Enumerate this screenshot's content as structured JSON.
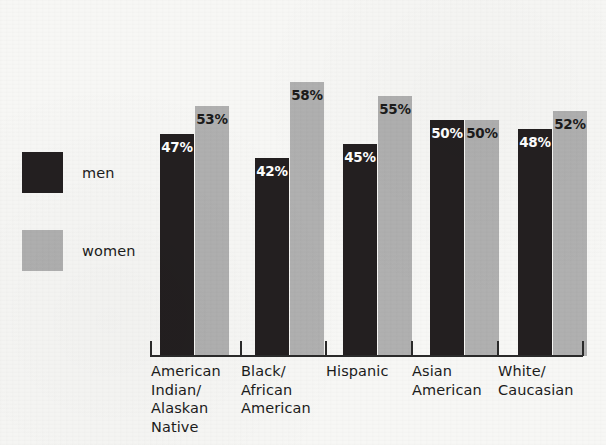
{
  "legend": {
    "items": [
      {
        "key": "men",
        "label": "men",
        "color": "#231f20"
      },
      {
        "key": "women",
        "label": "women",
        "color": "#b0b0b0"
      }
    ]
  },
  "chart_data": {
    "type": "bar",
    "title": "",
    "subtitle": "",
    "xlabel": "",
    "ylabel": "",
    "ylim": [
      0,
      100
    ],
    "grid": false,
    "legend_position": "left",
    "orientation": "vertical",
    "grouping": "grouped",
    "value_label_suffix": "%",
    "categories": [
      "American\nIndian/\nAlaskan\nNative",
      "Black/\nAfrican\nAmerican",
      "Hispanic",
      "Asian\nAmerican",
      "White/\nCaucasian"
    ],
    "series": [
      {
        "name": "men",
        "color": "#231f20",
        "values": [
          47,
          42,
          45,
          50,
          48
        ],
        "labels": [
          "47%",
          "42%",
          "45%",
          "50%",
          "48%"
        ]
      },
      {
        "name": "women",
        "color": "#b0b0b0",
        "values": [
          53,
          58,
          55,
          50,
          52
        ],
        "labels": [
          "53%",
          "58%",
          "55%",
          "50%",
          "52%"
        ]
      }
    ]
  },
  "layout": {
    "baseline_y": 356,
    "bar_width": 34,
    "group_left_positions": [
      160,
      255,
      343,
      430,
      518
    ],
    "tick_positions": [
      150,
      240,
      325,
      411,
      497,
      582
    ],
    "label_left_positions": [
      151,
      241,
      326,
      412,
      498
    ],
    "px_per_percent": 4.72
  },
  "background": {
    "color": "#f7f7f5"
  }
}
